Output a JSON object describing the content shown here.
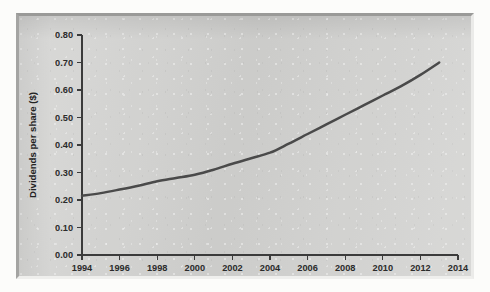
{
  "chart_data": {
    "type": "line",
    "title": "",
    "xlabel": "",
    "ylabel": "Dividends per share ($)",
    "xlim": [
      1994,
      2014
    ],
    "ylim": [
      0.0,
      0.8
    ],
    "grid": false,
    "legend": false,
    "legend_position": "none",
    "line_color": "#4a4a4a",
    "x_ticks": [
      1994,
      1996,
      1998,
      2000,
      2002,
      2004,
      2006,
      2008,
      2010,
      2012,
      2014
    ],
    "x_tick_labels": [
      "1994",
      "1996",
      "1998",
      "2000",
      "2002",
      "2004",
      "2006",
      "2008",
      "2010",
      "2012",
      "2014"
    ],
    "y_ticks": [
      0.0,
      0.1,
      0.2,
      0.3,
      0.4,
      0.5,
      0.6,
      0.7,
      0.8
    ],
    "y_tick_labels": [
      "0.00",
      "0.10",
      "0.20",
      "0.30",
      "0.40",
      "0.50",
      "0.60",
      "0.70",
      "0.80"
    ],
    "series": [
      {
        "name": "Dividends per share",
        "x": [
          1994,
          1995,
          1996,
          1997,
          1998,
          1999,
          2000,
          2001,
          2002,
          2003,
          2004,
          2005,
          2006,
          2007,
          2008,
          2009,
          2010,
          2011,
          2012,
          2013
        ],
        "values": [
          0.215,
          0.225,
          0.238,
          0.252,
          0.268,
          0.28,
          0.292,
          0.31,
          0.332,
          0.352,
          0.372,
          0.405,
          0.44,
          0.475,
          0.51,
          0.545,
          0.58,
          0.615,
          0.655,
          0.7
        ]
      }
    ]
  },
  "figure": {
    "panel_background": "#d2d2d0",
    "page_background": "#fcfcfa"
  }
}
